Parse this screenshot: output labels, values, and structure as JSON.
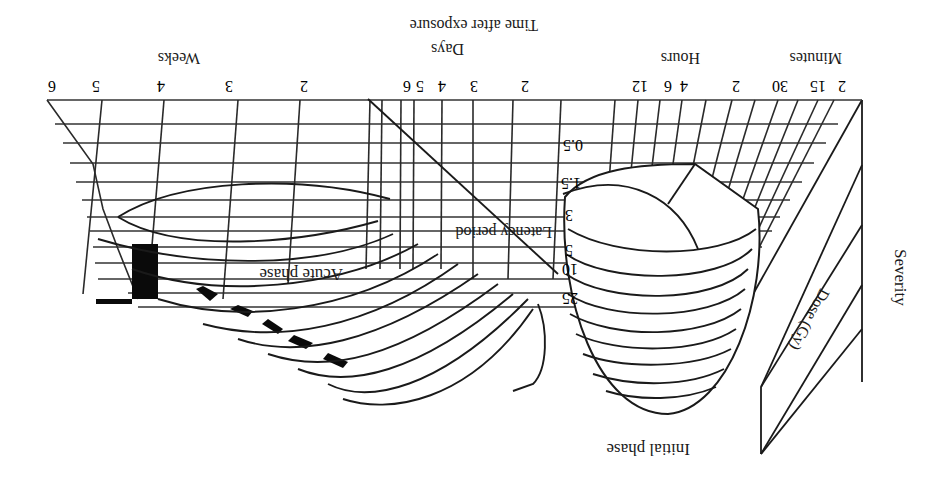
{
  "figure": {
    "orientation": "rotated-180",
    "axes": {
      "vertical_label": "Severity",
      "depth_label": "Dose (Gy)",
      "time_label": "Time after exposure",
      "time_units": {
        "minutes": "Minutes",
        "hours": "Hours",
        "days": "Days",
        "weeks": "Weeks"
      }
    },
    "time_ticks": {
      "minutes": [
        "2",
        "15",
        "30"
      ],
      "hours": [
        "2",
        "4",
        "6",
        "12"
      ],
      "days": [
        "2",
        "3",
        "4",
        "5",
        "6"
      ],
      "weeks": [
        "2",
        "3",
        "4",
        "5",
        "6"
      ]
    },
    "dose_ticks": [
      "0.5",
      "1.5",
      "3",
      "5",
      "10",
      "25"
    ],
    "annotations": {
      "initial_phase": "Initial phase",
      "latency_period": "Latency period",
      "acute_phase": "Acute phase"
    }
  }
}
